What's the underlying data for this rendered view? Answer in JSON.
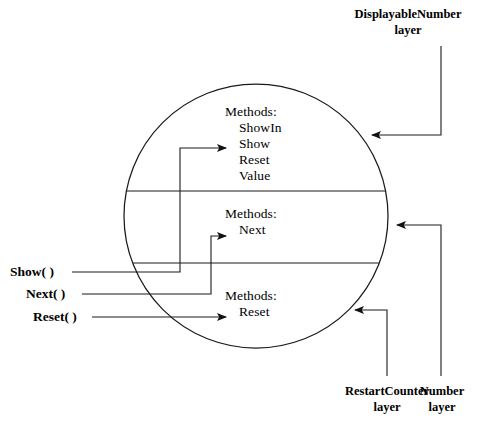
{
  "diagram": {
    "colors": {
      "stroke": "#1a1a1a",
      "background": "#ffffff",
      "text": "#000000"
    },
    "circle": {
      "center_x": 256,
      "center_y": 216,
      "radius": 132
    },
    "dividers": [
      {
        "y": 191
      },
      {
        "y": 263
      }
    ],
    "layers": [
      {
        "id": "displayable-number",
        "methods_heading": "Methods:",
        "methods": [
          "ShowIn",
          "Show",
          "Reset",
          "Value"
        ]
      },
      {
        "id": "number",
        "methods_heading": "Methods:",
        "methods": [
          "Next"
        ]
      },
      {
        "id": "restart-counter",
        "methods_heading": "Methods:",
        "methods": [
          "Reset"
        ]
      }
    ],
    "callouts": [
      {
        "id": "displayable-number-layer",
        "line1": "DisplayableNumber",
        "line2": "layer"
      },
      {
        "id": "restart-counter-layer",
        "line1": "RestartCounter",
        "line2": "layer"
      },
      {
        "id": "number-layer",
        "line1": "Number",
        "line2": "layer"
      }
    ],
    "operations": [
      {
        "id": "show-op",
        "label": "Show( )"
      },
      {
        "id": "next-op",
        "label": "Next( )"
      },
      {
        "id": "reset-op",
        "label": "Reset( )"
      }
    ]
  }
}
